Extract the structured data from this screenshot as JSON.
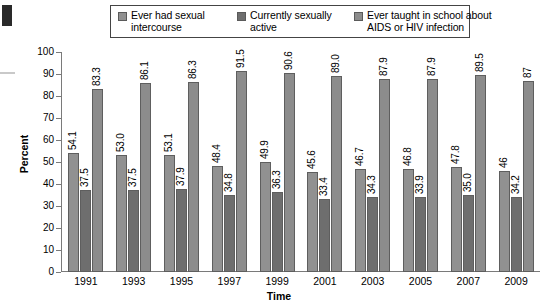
{
  "chart_data": {
    "type": "bar",
    "title": "",
    "xlabel": "Time",
    "ylabel": "Percent",
    "ylim": [
      0,
      100
    ],
    "ytick_step": 10,
    "yticks": [
      100,
      90,
      80,
      70,
      60,
      50,
      40,
      30,
      20,
      10,
      0
    ],
    "grid": false,
    "legend_position": "top",
    "categories": [
      "1991",
      "1993",
      "1995",
      "1997",
      "1999",
      "2001",
      "2003",
      "2005",
      "2007",
      "2009"
    ],
    "series": [
      {
        "name": "Ever had sexual intercourse",
        "color": "#919191",
        "values": [
          54.1,
          53.0,
          53.1,
          48.4,
          49.9,
          45.6,
          46.7,
          46.8,
          47.8,
          46
        ],
        "labels": [
          "54.1",
          "53.0",
          "53.1",
          "48.4",
          "49.9",
          "45.6",
          "46.7",
          "46.8",
          "47.8",
          "46"
        ]
      },
      {
        "name": "Currently sexually active",
        "color": "#6e6e6e",
        "values": [
          37.5,
          37.5,
          37.9,
          34.8,
          36.3,
          33.4,
          34.3,
          33.9,
          35.0,
          34.2
        ],
        "labels": [
          "37.5",
          "37.5",
          "37.9",
          "34.8",
          "36.3",
          "33.4",
          "34.3",
          "33.9",
          "35.0",
          "34.2"
        ]
      },
      {
        "name": "Ever taught in school about AIDS or HIV infection",
        "color": "#8c8c8c",
        "values": [
          83.3,
          86.1,
          86.3,
          91.5,
          90.6,
          89.0,
          87.9,
          87.9,
          89.5,
          87
        ],
        "labels": [
          "83.3",
          "86.1",
          "86.3",
          "91.5",
          "90.6",
          "89.0",
          "87.9",
          "87.9",
          "89.5",
          "87"
        ]
      }
    ]
  },
  "legend": {
    "entries": [
      {
        "line1": "Ever had sexual",
        "line2": "intercourse"
      },
      {
        "line1": "Currently sexually",
        "line2": "active"
      },
      {
        "line1": "Ever taught in school about",
        "line2": "AIDS or HIV infection"
      }
    ]
  }
}
